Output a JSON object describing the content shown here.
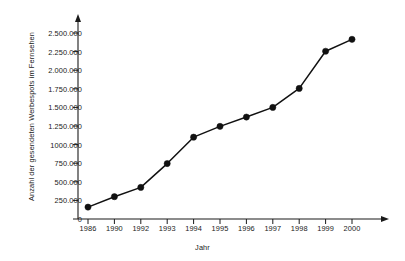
{
  "chart_data": {
    "type": "line",
    "title": "",
    "xlabel": "Jahr",
    "ylabel": "Anzahl der gesendeten Werbespots im Fernsehen",
    "categories": [
      "1986",
      "1990",
      "1992",
      "1993",
      "1994",
      "1995",
      "1996",
      "1997",
      "1998",
      "1999",
      "2000"
    ],
    "values": [
      160000,
      300000,
      425000,
      745000,
      1100000,
      1245000,
      1370000,
      1500000,
      1755000,
      2255000,
      2415000
    ],
    "series": [
      {
        "name": "Anzahl der gesendeten Werbespots im Fernsehen",
        "values": [
          160000,
          300000,
          425000,
          745000,
          1100000,
          1245000,
          1370000,
          1500000,
          1755000,
          2255000,
          2415000
        ]
      }
    ],
    "ylim": [
      0,
      2500000
    ],
    "ytick_values": [
      0,
      250000,
      500000,
      750000,
      1000000,
      1250000,
      1500000,
      1750000,
      2000000,
      2250000,
      2500000
    ],
    "ytick_labels": [
      "0",
      "250.000",
      "500.000",
      "750.000",
      "1000.000",
      "1.250.000",
      "1.500.000",
      "1.750.000",
      "2.000.000",
      "2.250.000",
      "2.500.000"
    ],
    "grid": false,
    "legend": "none",
    "marker": "filled-circle",
    "line_color": "#111111",
    "marker_color": "#111111",
    "axis_color": "#1a1a1a",
    "background_color": "#ffffff",
    "y_axis_arrow": true,
    "x_axis_arrow": true
  }
}
